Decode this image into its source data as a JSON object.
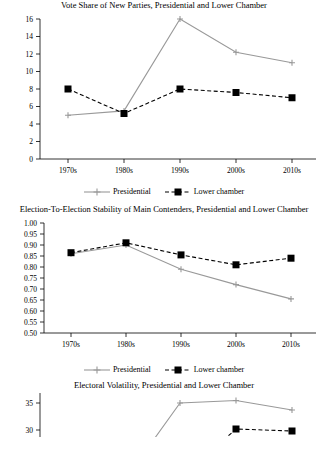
{
  "charts": [
    {
      "title": "Vote Share of New Parties, Presidential and Lower Chamber",
      "type": "line",
      "categories": [
        "1970s",
        "1980s",
        "1990s",
        "2000s",
        "2010s"
      ],
      "series": [
        {
          "name": "Presidential",
          "values": [
            5.0,
            5.5,
            16.0,
            12.2,
            11.0
          ]
        },
        {
          "name": "Lower chamber",
          "values": [
            8.0,
            5.2,
            8.0,
            7.6,
            7.0
          ]
        }
      ],
      "ylim": [
        0,
        16
      ],
      "yticks": [
        "0",
        "2",
        "4",
        "6",
        "8",
        "10",
        "12",
        "14",
        "16"
      ],
      "xlabel": "",
      "ylabel": "",
      "grid": false,
      "legend_position": "bottom"
    },
    {
      "title": "Election-To-Election Stability of Main Contenders, Presidential and Lower Chamber",
      "type": "line",
      "categories": [
        "1970s",
        "1980s",
        "1990s",
        "2000s",
        "2010s"
      ],
      "series": [
        {
          "name": "Presidential",
          "values": [
            0.86,
            0.9,
            0.79,
            0.72,
            0.655
          ]
        },
        {
          "name": "Lower chamber",
          "values": [
            0.865,
            0.91,
            0.855,
            0.81,
            0.84
          ]
        }
      ],
      "ylim": [
        0.5,
        1.0
      ],
      "yticks": [
        "1.00",
        "0.95",
        "0.90",
        "0.85",
        "0.80",
        "0.75",
        "0.70",
        "0.65",
        "0.60",
        "0.55",
        "0.50"
      ],
      "xlabel": "",
      "ylabel": "",
      "grid": false,
      "legend_position": "bottom"
    },
    {
      "title": "Electoral Volatility, Presidential and Lower Chamber",
      "type": "line",
      "categories": [
        "1970s",
        "1980s",
        "1990s",
        "2000s",
        "2010s"
      ],
      "series": [
        {
          "name": "Presidential",
          "values": [
            null,
            null,
            35.0,
            35.4,
            33.2
          ]
        },
        {
          "name": "Lower chamber",
          "values": [
            null,
            null,
            null,
            null,
            null
          ]
        }
      ],
      "ylim": [
        28,
        36
      ],
      "yticks": [
        "35",
        "30"
      ],
      "xlabel": "",
      "ylabel": "",
      "grid": false,
      "legend_position": "bottom"
    }
  ],
  "legend_labels": {
    "presidential": "Presidential",
    "lower_chamber": "Lower chamber"
  },
  "colors": {
    "presidential_line": "#999999",
    "lower_chamber_line": "#000000",
    "axis": "#000000",
    "text": "#000000",
    "background": "#ffffff"
  }
}
